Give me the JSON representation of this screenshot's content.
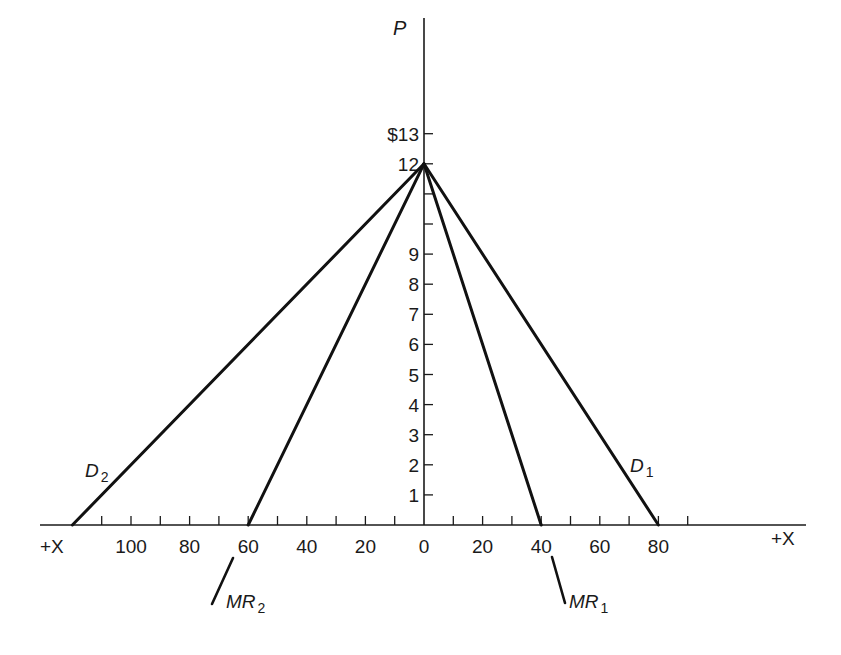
{
  "chart_data": {
    "type": "line",
    "title": "",
    "ylabel": "P",
    "xlabel_left": "+X",
    "xlabel_right": "+X",
    "y_currency_prefix": "$",
    "ylim": [
      0,
      13
    ],
    "xlim_left": [
      0,
      120
    ],
    "xlim_right": [
      0,
      90
    ],
    "grid": false,
    "y_ticks": [
      1,
      2,
      3,
      4,
      5,
      6,
      7,
      8,
      9,
      10,
      11,
      12,
      13
    ],
    "y_tick_labels": [
      {
        "value": 1,
        "label": "1"
      },
      {
        "value": 2,
        "label": "2"
      },
      {
        "value": 3,
        "label": "3"
      },
      {
        "value": 4,
        "label": "4"
      },
      {
        "value": 5,
        "label": "5"
      },
      {
        "value": 6,
        "label": "6"
      },
      {
        "value": 7,
        "label": "7"
      },
      {
        "value": 8,
        "label": "8"
      },
      {
        "value": 9,
        "label": "9"
      },
      {
        "value": 12,
        "label": "12"
      },
      {
        "value": 13,
        "label": "$13"
      }
    ],
    "x_ticks_left": [
      10,
      20,
      30,
      40,
      50,
      60,
      70,
      80,
      90,
      100,
      110
    ],
    "x_tick_labels_left": [
      {
        "value": 20,
        "label": "20"
      },
      {
        "value": 40,
        "label": "40"
      },
      {
        "value": 60,
        "label": "60"
      },
      {
        "value": 80,
        "label": "80"
      },
      {
        "value": 100,
        "label": "100"
      }
    ],
    "x_ticks_right": [
      10,
      20,
      30,
      40,
      50,
      60,
      70,
      80,
      90
    ],
    "x_tick_labels_right": [
      {
        "value": 0,
        "label": "0"
      },
      {
        "value": 20,
        "label": "20"
      },
      {
        "value": 40,
        "label": "40"
      },
      {
        "value": 60,
        "label": "60"
      },
      {
        "value": 80,
        "label": "80"
      }
    ],
    "series": [
      {
        "name": "D1",
        "label": "D",
        "subscript": "1",
        "side": "right",
        "points": [
          [
            0,
            12
          ],
          [
            80,
            0
          ]
        ]
      },
      {
        "name": "MR1",
        "label": "MR",
        "subscript": "1",
        "side": "right",
        "points": [
          [
            0,
            12
          ],
          [
            40,
            0
          ]
        ]
      },
      {
        "name": "D2",
        "label": "D",
        "subscript": "2",
        "side": "left",
        "points": [
          [
            0,
            12
          ],
          [
            120,
            0
          ]
        ]
      },
      {
        "name": "MR2",
        "label": "MR",
        "subscript": "2",
        "side": "left",
        "points": [
          [
            0,
            12
          ],
          [
            60,
            0
          ]
        ]
      }
    ]
  }
}
